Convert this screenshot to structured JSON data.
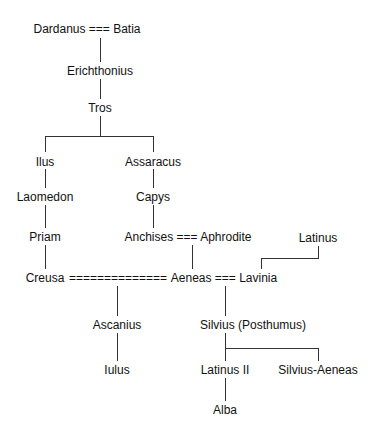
{
  "diagram": {
    "type": "family-tree",
    "nodes": {
      "dardanus_batia": "Dardanus === Batia",
      "erichthonius": "Erichthonius",
      "tros": "Tros",
      "ilus": "Ilus",
      "assaracus": "Assaracus",
      "laomedon": "Laomedon",
      "capys": "Capys",
      "priam": "Priam",
      "anchises_aphrodite": "Anchises === Aphrodite",
      "latinus": "Latinus",
      "creusa": "Creusa",
      "marriage_link": "==============",
      "aeneas_lavinia": "Aeneas === Lavinia",
      "ascanius": "Ascanius",
      "silvius": "Silvius (Posthumus)",
      "iulus": "Iulus",
      "latinus_ii": "Latinus II",
      "silvius_aeneas": "Silvius-Aeneas",
      "alba": "Alba"
    },
    "edges": [
      [
        "Dardanus === Batia",
        "Erichthonius"
      ],
      [
        "Erichthonius",
        "Tros"
      ],
      [
        "Tros",
        "Ilus"
      ],
      [
        "Tros",
        "Assaracus"
      ],
      [
        "Ilus",
        "Laomedon"
      ],
      [
        "Laomedon",
        "Priam"
      ],
      [
        "Priam",
        "Creusa"
      ],
      [
        "Assaracus",
        "Capys"
      ],
      [
        "Capys",
        "Anchises === Aphrodite"
      ],
      [
        "Anchises === Aphrodite",
        "Aeneas"
      ],
      [
        "Latinus",
        "Lavinia"
      ],
      [
        "Creusa === Aeneas",
        "Ascanius"
      ],
      [
        "Ascanius",
        "Iulus"
      ],
      [
        "Aeneas === Lavinia",
        "Silvius (Posthumus)"
      ],
      [
        "Silvius (Posthumus)",
        "Latinus II"
      ],
      [
        "Silvius (Posthumus)",
        "Silvius-Aeneas"
      ],
      [
        "Latinus II",
        "Alba"
      ]
    ]
  }
}
